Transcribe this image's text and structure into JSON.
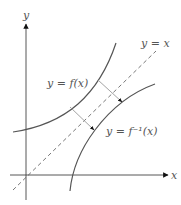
{
  "diagram": {
    "axes": {
      "x_label": "x",
      "y_label": "y"
    },
    "curves": [
      {
        "name": "f",
        "label_parts": [
          "y = ",
          "f",
          "(",
          "x",
          ")"
        ],
        "label": "y = f(x)"
      },
      {
        "name": "f-inverse",
        "label": "y = f⁻¹(x)"
      }
    ],
    "reference_line": {
      "label": "y = x",
      "style": "dashed"
    },
    "arrows": [
      {
        "description": "reflection arrow from f to f inverse (lower)"
      },
      {
        "description": "reflection arrow from f to f inverse (upper)"
      }
    ],
    "colors": {
      "curve": "#555555",
      "axis": "#444444",
      "arrow": "#999999",
      "arrowhead": "#111111",
      "text": "#555555"
    }
  }
}
